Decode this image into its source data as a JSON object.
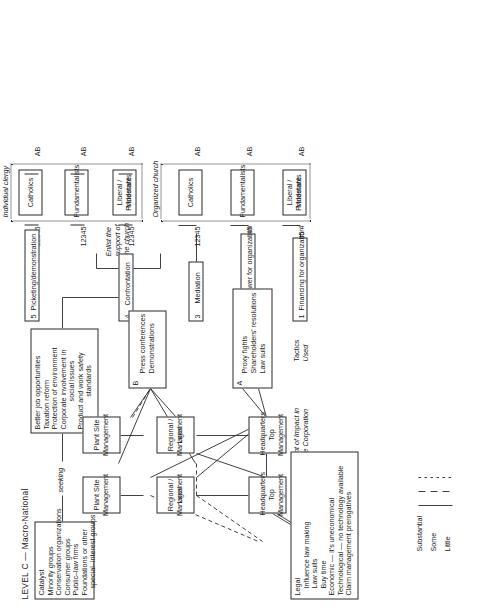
{
  "title": "LEVEL C — Macro-National",
  "catalyst": {
    "heading": "Catalyst",
    "items": [
      "Minority groups",
      "Conservation organizations",
      "Consumer groups",
      "Public–law firms",
      "Foundations or other",
      "special–interest groups"
    ]
  },
  "connector_seeking": "seeking",
  "goals": {
    "items": [
      "Better job opportunities",
      "Taxation reform",
      "Protection of environment",
      "Corporate involvement in",
      "social issues",
      "Product and work safety",
      "standards"
    ]
  },
  "church": {
    "enlist_note": [
      "Enlist the",
      "support of",
      "the church"
    ],
    "group_labels": {
      "organized": "Organized church",
      "individual": "Individual clergy"
    },
    "organized_boxes": [
      {
        "line1": "Liberal / Moderate",
        "line2": "Protestants",
        "left_scale": "1235 4",
        "right_scale": "AB"
      },
      {
        "line1": "Fundamentalists",
        "line2": "",
        "left_scale": "12345",
        "right_scale": "AB"
      },
      {
        "line1": "Catholics",
        "line2": "",
        "left_scale": "12345",
        "right_scale": "AB"
      }
    ],
    "individual_boxes": [
      {
        "line1": "Liberal / Moderate",
        "line2": "Protestants",
        "left_scale": "12345",
        "right_scale": "AB"
      },
      {
        "line1": "Fundamentalists",
        "line2": "",
        "left_scale": "12345",
        "right_scale": "AB"
      },
      {
        "line1": "Catholics",
        "line2": "",
        "left_scale": "12345",
        "right_scale": "AB"
      }
    ]
  },
  "numbered_tactics": [
    {
      "num": "1",
      "label": "Financing for organization"
    },
    {
      "num": "2",
      "label": "Manpower for organization"
    },
    {
      "num": "3",
      "label": "Mediation"
    },
    {
      "num": "4",
      "label": "Confrontation"
    },
    {
      "num": "5",
      "label": "Picketing/demonstration"
    }
  ],
  "tactics_used": {
    "label_line1": "Tactics",
    "label_line2": "Used",
    "box_a": {
      "key": "A",
      "items": [
        "Proxy fights",
        "Shareholders' resolutions",
        "Law suits"
      ]
    },
    "box_b": {
      "key": "B",
      "items": [
        "Press conferences",
        "Demonstrations"
      ]
    }
  },
  "point_of_impact": {
    "label_line1": "Point of Impact in",
    "label_line2": "the Corporation",
    "boxes": [
      {
        "line1": "Headquarters",
        "line2": "Top Management"
      },
      {
        "line1": "Regional / Local",
        "line2": "Management"
      },
      {
        "line1": "Plant Site",
        "line2": "Management"
      }
    ]
  },
  "decision_making": {
    "label_line1": "Decision–Making in",
    "label_line2": "the Corporation",
    "boxes": [
      {
        "line1": "Headquarters",
        "line2": "Top Management"
      },
      {
        "line1": "Regional / Local",
        "line2": "Management"
      },
      {
        "line1": "Plant Site",
        "line2": "Management"
      }
    ]
  },
  "strategies": {
    "label": "Strategies",
    "items": [
      "Legal",
      "Influence law making",
      "Law suits",
      "Buy time",
      "Economic — it's uneconomical",
      "Technological — no technology available",
      "Claim management prerogatives"
    ]
  },
  "legend": {
    "entries": [
      {
        "label": "Substantial",
        "style": "solid"
      },
      {
        "label": "Some",
        "style": "dashed"
      },
      {
        "label": "Little",
        "style": "dotted"
      }
    ]
  }
}
